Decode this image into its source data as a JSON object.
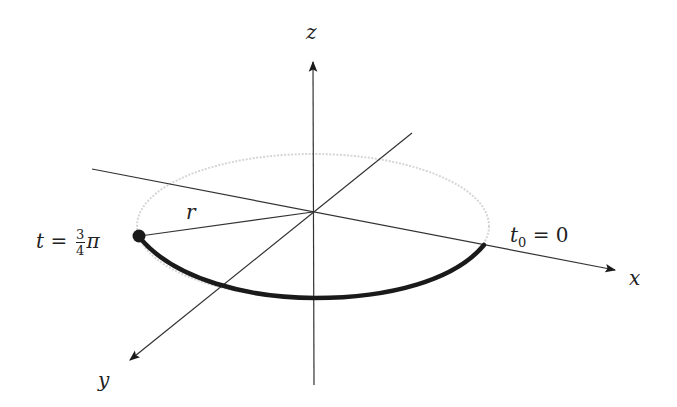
{
  "diagram": {
    "axes": {
      "x": {
        "label": "x"
      },
      "y": {
        "label": "y"
      },
      "z": {
        "label": "z"
      }
    },
    "radius_label": "r",
    "start_label": {
      "var": "t",
      "sub": "0",
      "eq": "=",
      "value": "0"
    },
    "end_label": {
      "var": "t",
      "eq": "=",
      "num": "3",
      "den": "4",
      "pi": "π"
    },
    "colors": {
      "axis": "#333333",
      "path": "#1a1a1a",
      "circle_faint": "#d8d8d8"
    }
  }
}
